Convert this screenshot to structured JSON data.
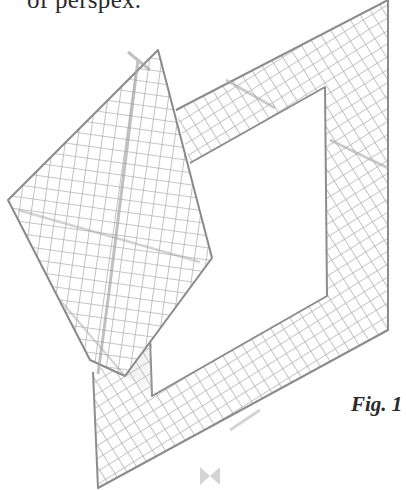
{
  "text": {
    "caption_fragment": "of perspex.",
    "figure_label": "Fig. 1"
  },
  "drawing": {
    "description": "Pencil sketch of a square sheet of gridded perspex folded over a square frame",
    "stroke_color": "#8a8a8a",
    "grid_color": "#b8b8b8",
    "fill_color": "#ffffff"
  },
  "ornament": {
    "icon": "bowtie-ornament-icon",
    "color": "#d0d0d0"
  }
}
